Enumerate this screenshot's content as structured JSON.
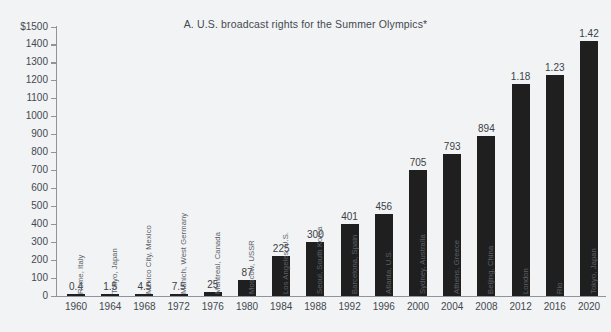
{
  "chart_data": {
    "type": "bar",
    "title": "A.  U.S. broadcast rights for the Summer Olympics*",
    "xlabel": "",
    "ylabel": "",
    "ylim": [
      0,
      1500
    ],
    "ytick_labels": [
      "$1500",
      "1400",
      "1300",
      "1200",
      "1100",
      "1000",
      "900",
      "800",
      "700",
      "600",
      "500",
      "400",
      "300",
      "200",
      "100",
      "0"
    ],
    "ytick_values": [
      1500,
      1400,
      1300,
      1200,
      1100,
      1000,
      900,
      800,
      700,
      600,
      500,
      400,
      300,
      200,
      100,
      0
    ],
    "grid": false,
    "legend": "none",
    "units_note": "values in millions of U.S. dollars; labels 1.18 / 1.23 / 1.42 denote billions",
    "categories": [
      "1960",
      "1964",
      "1968",
      "1972",
      "1976",
      "1980",
      "1984",
      "1988",
      "1992",
      "1996",
      "2000",
      "2004",
      "2008",
      "2012",
      "2016",
      "2020"
    ],
    "values": [
      0.4,
      1.5,
      4.5,
      7.5,
      25,
      87,
      225,
      300,
      401,
      456,
      705,
      793,
      894,
      1180,
      1230,
      1420
    ],
    "value_labels": [
      "0.4",
      "1.5",
      "4.5",
      "7.5",
      "25",
      "87",
      "225",
      "300",
      "401",
      "456",
      "705",
      "793",
      "894",
      "1.18",
      "1.23",
      "1.42"
    ],
    "point_labels": [
      "Rome, Italy",
      "Tokyo, Japan",
      "Mexico City, Mexico",
      "Munich, West Germany",
      "Montreal, Canada",
      "Moscow, USSR",
      "Los Angeles, U.S.",
      "Seoul, South Korea",
      "Barcelona, Spain",
      "Atlanta, U.S.",
      "Sydney, Australia",
      "Athens, Greece",
      "Beijing, China",
      "London",
      "Rio",
      "Tokyo, Japan"
    ],
    "colors": {
      "background": "#f2f3f5",
      "bar": "#1f1f1f",
      "axis": "#8e949b",
      "text": "#44494f",
      "city_text": "#5b6168"
    }
  }
}
